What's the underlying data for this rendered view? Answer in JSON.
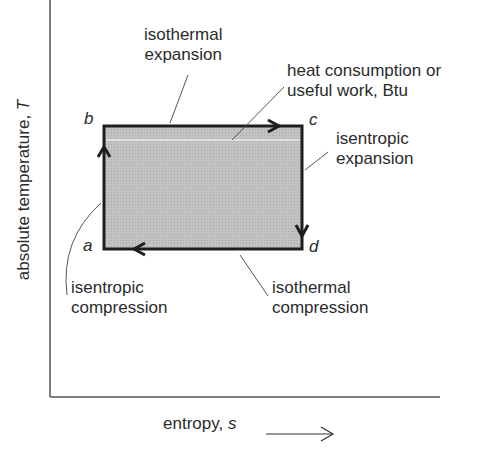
{
  "diagram": {
    "type": "T-s diagram (Carnot cycle)",
    "axes": {
      "y_label": "absolute temperature, ",
      "y_var": "T",
      "x_label": "entropy, ",
      "x_var": "s"
    },
    "points": {
      "a": "a",
      "b": "b",
      "c": "c",
      "d": "d"
    },
    "annotations": {
      "isothermal_expansion": [
        "isothermal",
        "expansion"
      ],
      "heat_consumption": [
        "heat consumption or",
        "useful work, Btu"
      ],
      "isentropic_expansion": [
        "isentropic",
        "expansion"
      ],
      "isentropic_compression": [
        "isentropic",
        "compression"
      ],
      "isothermal_compression": [
        "isothermal",
        "compression"
      ]
    },
    "colors": {
      "fill": "#b9b9b9",
      "stroke": "#1e1e1e",
      "axis": "#555555",
      "leader": "#555555"
    }
  }
}
